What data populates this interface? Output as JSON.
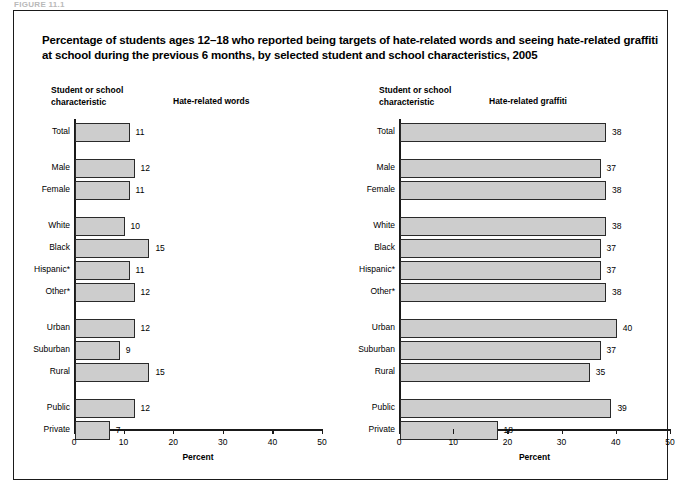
{
  "top_caption": "FIGURE 11.1",
  "figure": {
    "title": "Percentage of students ages 12–18 who reported being targets of hate-related words and seeing hate-related graffiti at school during the previous 6 months, by selected student and school characteristics, 2005"
  },
  "chart_data": [
    {
      "type": "bar",
      "orientation": "horizontal",
      "title": "Hate-related words",
      "category_axis_label": "Student or school\ncharacteristic",
      "xlabel": "Percent",
      "ylabel": "",
      "xlim": [
        0,
        50
      ],
      "xticks": [
        0,
        10,
        20,
        30,
        40,
        50
      ],
      "grid": false,
      "legend": "none",
      "categories": [
        "Total",
        "Male",
        "Female",
        "White",
        "Black",
        "Hispanic*",
        "Other*",
        "Urban",
        "Suburban",
        "Rural",
        "Public",
        "Private"
      ],
      "values": [
        11,
        12,
        11,
        10,
        15,
        11,
        12,
        12,
        9,
        15,
        12,
        7
      ],
      "groups": [
        {
          "name": "overall",
          "categories": [
            "Total"
          ]
        },
        {
          "name": "sex",
          "categories": [
            "Male",
            "Female"
          ]
        },
        {
          "name": "race-ethnicity",
          "categories": [
            "White",
            "Black",
            "Hispanic*",
            "Other*"
          ]
        },
        {
          "name": "urbanicity",
          "categories": [
            "Urban",
            "Suburban",
            "Rural"
          ]
        },
        {
          "name": "school-control",
          "categories": [
            "Public",
            "Private"
          ]
        }
      ]
    },
    {
      "type": "bar",
      "orientation": "horizontal",
      "title": "Hate-related graffiti",
      "category_axis_label": "Student or school\ncharacteristic",
      "xlabel": "Percent",
      "ylabel": "",
      "xlim": [
        0,
        50
      ],
      "xticks": [
        0,
        10,
        20,
        30,
        40,
        50
      ],
      "grid": false,
      "legend": "none",
      "categories": [
        "Total",
        "Male",
        "Female",
        "White",
        "Black",
        "Hispanic*",
        "Other*",
        "Urban",
        "Suburban",
        "Rural",
        "Public",
        "Private"
      ],
      "values": [
        38,
        37,
        38,
        38,
        37,
        37,
        38,
        40,
        37,
        35,
        39,
        18
      ],
      "groups": [
        {
          "name": "overall",
          "categories": [
            "Total"
          ]
        },
        {
          "name": "sex",
          "categories": [
            "Male",
            "Female"
          ]
        },
        {
          "name": "race-ethnicity",
          "categories": [
            "White",
            "Black",
            "Hispanic*",
            "Other*"
          ]
        },
        {
          "name": "urbanicity",
          "categories": [
            "Urban",
            "Suburban",
            "Rural"
          ]
        },
        {
          "name": "school-control",
          "categories": [
            "Public",
            "Private"
          ]
        }
      ]
    }
  ],
  "style": {
    "bar_fill": "#cdcdcd",
    "bar_stroke": "#2a2a2a",
    "axis_color": "#1a1a1a",
    "text_color": "#000000",
    "background": "#ffffff"
  }
}
